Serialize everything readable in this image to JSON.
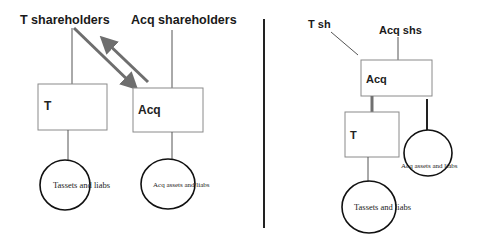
{
  "left_diagram": {
    "t_shareholders_label": "T shareholders",
    "acq_shareholders_label": "Acq shareholders",
    "t_box_label": "T",
    "acq_box_label": "Acq",
    "t_assets_label": "Tassets and liabs",
    "acq_assets_label": "Acq assets and liabs"
  },
  "right_diagram": {
    "t_sh_label": "T sh",
    "acq_shs_label": "Acq shs",
    "acq_box_label": "Acq",
    "t_box_label": "T",
    "t_assets_label": "Tassets and liabs",
    "acq_assets_label": "Acq assets and liabs"
  },
  "colors": {
    "arrow": "#6e6e6e",
    "thick_connector": "#707070",
    "box_border": "#8a8a8a",
    "circle_border": "#111111",
    "divider": "#222222"
  }
}
